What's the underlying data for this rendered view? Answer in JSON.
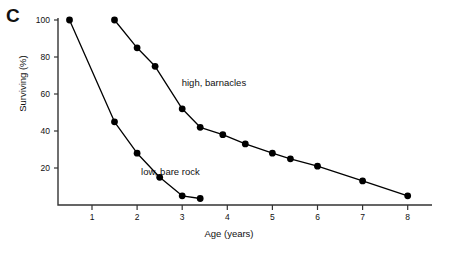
{
  "figure": {
    "panel_letter": "C",
    "xlabel": "Age (years)",
    "ylabel": "Surviving (%)",
    "marker_color": "#000000",
    "line_color": "#000000",
    "axis_color": "#333333"
  },
  "axes": {
    "y_ticks": [
      "20",
      "40",
      "60",
      "80",
      "100"
    ],
    "x_ticks": [
      "1",
      "2",
      "3",
      "4",
      "5",
      "6",
      "7",
      "8"
    ]
  },
  "series_labels": {
    "high": "high, barnacles",
    "low": "low, bare rock"
  },
  "chart_data": {
    "type": "line",
    "title": "",
    "subtitle": "",
    "panel": "C",
    "xlabel": "Age (years)",
    "ylabel": "Surviving (%)",
    "xlim": [
      0,
      8.6
    ],
    "ylim": [
      0,
      103
    ],
    "xticks": [
      1,
      2,
      3,
      4,
      5,
      6,
      7,
      8
    ],
    "yticks": [
      20,
      40,
      60,
      80,
      100
    ],
    "grid": false,
    "legend": "inline-annotations",
    "marker": "filled-circle",
    "series": [
      {
        "name": "low, bare rock",
        "label_position": {
          "x": 2.2,
          "y": 18
        },
        "points": [
          {
            "x": 0.5,
            "y": 100
          },
          {
            "x": 1.5,
            "y": 45
          },
          {
            "x": 2.0,
            "y": 28
          },
          {
            "x": 2.5,
            "y": 15
          },
          {
            "x": 3.0,
            "y": 5
          },
          {
            "x": 3.4,
            "y": 3.5
          }
        ]
      },
      {
        "name": "high, barnacles",
        "label_position": {
          "x": 3.1,
          "y": 66
        },
        "points": [
          {
            "x": 1.5,
            "y": 100
          },
          {
            "x": 2.0,
            "y": 85
          },
          {
            "x": 2.4,
            "y": 75
          },
          {
            "x": 3.0,
            "y": 52
          },
          {
            "x": 3.4,
            "y": 42
          },
          {
            "x": 3.9,
            "y": 38
          },
          {
            "x": 4.4,
            "y": 33
          },
          {
            "x": 5.0,
            "y": 28
          },
          {
            "x": 5.4,
            "y": 25
          },
          {
            "x": 6.0,
            "y": 21
          },
          {
            "x": 7.0,
            "y": 13
          },
          {
            "x": 8.0,
            "y": 5
          }
        ]
      }
    ]
  }
}
